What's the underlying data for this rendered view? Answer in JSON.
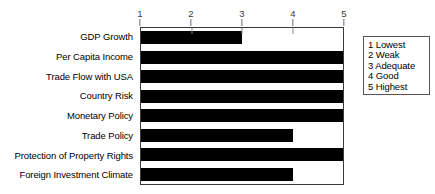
{
  "chart_data": {
    "type": "bar",
    "orientation": "horizontal",
    "title": "",
    "xlabel": "",
    "ylabel": "",
    "xlim": [
      1,
      5
    ],
    "grid": false,
    "categories": [
      "GDP Growth",
      "Per Capita Income",
      "Trade Flow with USA",
      "Country Risk",
      "Monetary Policy",
      "Trade Policy",
      "Protection of Property Rights",
      "Foreign Investment Climate"
    ],
    "values": [
      3,
      5,
      5,
      5,
      5,
      4,
      5,
      4
    ],
    "xticks": [
      "1",
      "2",
      "3",
      "4",
      "5"
    ],
    "xtick_values": [
      1,
      2,
      3,
      4,
      5
    ],
    "legend_position": "right",
    "legend_title": "",
    "legend_entries": [
      "1 Lowest",
      "2 Weak",
      "3 Adequate",
      "4 Good",
      "5 Highest"
    ],
    "bar_color": "#000000",
    "plot_border_color": "#3a3a3a",
    "background_color": "#ffffff"
  }
}
